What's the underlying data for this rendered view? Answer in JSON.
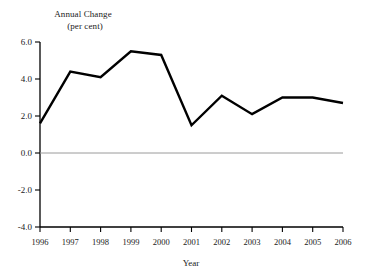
{
  "chart_data": {
    "type": "line",
    "title": "",
    "ylabel_lines": [
      "Annual Change",
      "(per cent)"
    ],
    "ylabel": "Annual Change (per cent)",
    "xlabel": "Year",
    "categories": [
      "1996",
      "1997",
      "1998",
      "1999",
      "2000",
      "2001",
      "2002",
      "2003",
      "2004",
      "2005",
      "2006"
    ],
    "x": [
      1996,
      1997,
      1998,
      1999,
      2000,
      2001,
      2002,
      2003,
      2004,
      2005,
      2006
    ],
    "values": [
      1.6,
      4.4,
      4.1,
      5.5,
      5.3,
      1.5,
      3.1,
      2.1,
      3.0,
      3.0,
      2.7
    ],
    "series": [
      {
        "name": "Annual Change",
        "values": [
          1.6,
          4.4,
          4.1,
          5.5,
          5.3,
          1.5,
          3.1,
          2.1,
          3.0,
          3.0,
          2.7
        ]
      }
    ],
    "ylim": [
      -4.0,
      6.0
    ],
    "xlim": [
      1996,
      2006
    ],
    "yticks": [
      6.0,
      4.0,
      2.0,
      0.0,
      -2.0,
      -4.0
    ],
    "ytick_labels": [
      "6.0",
      "4.0",
      "2.0",
      "0.0",
      "-2.0",
      "-4.0"
    ],
    "xticks": [
      1996,
      1997,
      1998,
      1999,
      2000,
      2001,
      2002,
      2003,
      2004,
      2005,
      2006
    ],
    "xtick_labels": [
      "1996",
      "1997",
      "1998",
      "1999",
      "2000",
      "2001",
      "2002",
      "2003",
      "2004",
      "2005",
      "2006"
    ],
    "grid": false,
    "zero_line": 0.0,
    "legend": null,
    "legend_position": "none",
    "colors": {
      "line": "#000000",
      "axis": "#000000",
      "zero_line": "#9a9a9a",
      "background": "#ffffff",
      "text": "#1a1a1a"
    },
    "line_width": 2.4,
    "annotations": []
  }
}
